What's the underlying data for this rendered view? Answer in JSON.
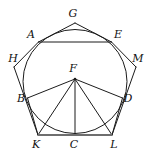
{
  "figure": {
    "type": "geometric-diagram",
    "canvas": {
      "width": 151,
      "height": 152
    },
    "colors": {
      "stroke": "#1b1b1b",
      "baseline": "#6e6e6e",
      "background": "#ffffff",
      "label": "#111111"
    },
    "circle": {
      "cx": 75,
      "cy": 81.5,
      "r": 52
    },
    "points": [
      {
        "id": "G",
        "label": "G",
        "x": 75,
        "y": 23,
        "label_x": 73,
        "label_y": 13,
        "role": "outer-pentagon-apex"
      },
      {
        "id": "H",
        "label": "H",
        "x": 14,
        "y": 67,
        "label_x": 13,
        "label_y": 58,
        "role": "outer-pentagon-vertex"
      },
      {
        "id": "M",
        "label": "M",
        "x": 136,
        "y": 67,
        "label_x": 138,
        "label_y": 58,
        "role": "outer-pentagon-vertex"
      },
      {
        "id": "K",
        "label": "K",
        "x": 38,
        "y": 135,
        "label_x": 36,
        "label_y": 144,
        "role": "outer-pentagon-vertex"
      },
      {
        "id": "L",
        "label": "L",
        "x": 112,
        "y": 135,
        "label_x": 114,
        "label_y": 144,
        "role": "outer-pentagon-vertex"
      },
      {
        "id": "A",
        "label": "A",
        "x": 38.5,
        "y": 42,
        "label_x": 31,
        "label_y": 34,
        "role": "inner-pentagon-vertex-on-circle"
      },
      {
        "id": "E",
        "label": "E",
        "x": 111.5,
        "y": 42,
        "label_x": 118,
        "label_y": 34,
        "role": "inner-pentagon-vertex-on-circle"
      },
      {
        "id": "B",
        "label": "B",
        "x": 27.5,
        "y": 98,
        "label_x": 21,
        "label_y": 98,
        "role": "inner-pentagon-vertex-on-circle"
      },
      {
        "id": "D",
        "label": "D",
        "x": 122.5,
        "y": 98,
        "label_x": 128,
        "label_y": 98,
        "role": "inner-pentagon-vertex-on-circle"
      },
      {
        "id": "F",
        "label": "F",
        "x": 75,
        "y": 79,
        "label_x": 73,
        "label_y": 68,
        "role": "fan-apex"
      },
      {
        "id": "C",
        "label": "C",
        "x": 75,
        "y": 135,
        "label_x": 74,
        "label_y": 144,
        "role": "baseline-midpoint"
      }
    ],
    "segments": [
      {
        "name": "outer-G-A",
        "from": "G",
        "to": "A"
      },
      {
        "name": "outer-G-E",
        "from": "G",
        "to": "E"
      },
      {
        "name": "outer-A-H",
        "from": "A",
        "to": "H"
      },
      {
        "name": "outer-E-M",
        "from": "E",
        "to": "M"
      },
      {
        "name": "outer-H-K",
        "from": "H",
        "to": "K"
      },
      {
        "name": "outer-M-L",
        "from": "M",
        "to": "L"
      },
      {
        "name": "inner-A-E",
        "from": "A",
        "to": "E"
      },
      {
        "name": "inner-B-F",
        "from": "B",
        "to": "F"
      },
      {
        "name": "inner-F-D",
        "from": "F",
        "to": "D"
      },
      {
        "name": "fan-F-K",
        "from": "F",
        "to": "K"
      },
      {
        "name": "fan-F-C",
        "from": "F",
        "to": "C"
      },
      {
        "name": "fan-F-L",
        "from": "F",
        "to": "L"
      },
      {
        "name": "side-B-K",
        "from": "B",
        "to": "K"
      },
      {
        "name": "side-D-L",
        "from": "D",
        "to": "L"
      },
      {
        "name": "baseline-K-L",
        "from": "K",
        "to": "L",
        "emphasis": "thick-gray"
      }
    ]
  }
}
